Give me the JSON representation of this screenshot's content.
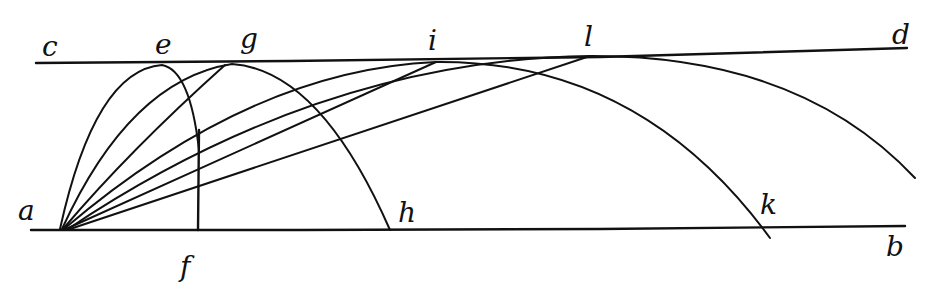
{
  "figure": {
    "ink_color": "#111111",
    "paper_color": "#ffffff"
  },
  "labels": {
    "c": "c",
    "e": "e",
    "g": "g",
    "i": "i",
    "l": "l",
    "d": "d",
    "a": "a",
    "f": "f",
    "h": "h",
    "k": "k",
    "b": "b"
  },
  "elements": {
    "top_line": {
      "from": "c",
      "to": "d"
    },
    "bottom_line": {
      "from": "a",
      "to": "b"
    },
    "vertical": {
      "from": "e",
      "to": "f"
    },
    "trajectories": [
      {
        "name": "trajectory-ae",
        "vertex": "e",
        "lands_at": "f"
      },
      {
        "name": "trajectory-ag",
        "vertex": "g",
        "lands_at": "h"
      },
      {
        "name": "trajectory-ai",
        "vertex": "i",
        "lands_at": "k"
      },
      {
        "name": "trajectory-al",
        "vertex": "l",
        "lands_at": "beyond b"
      }
    ]
  }
}
